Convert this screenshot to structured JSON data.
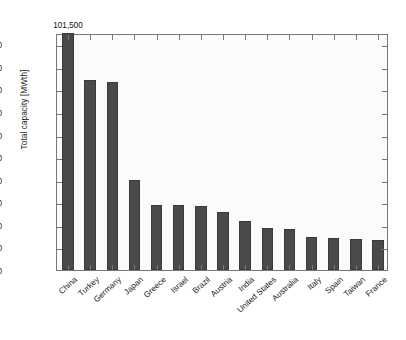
{
  "chart_data": {
    "type": "bar",
    "title": "",
    "xlabel": "",
    "ylabel": "Total capacity [MWth]",
    "ylim": [
      0,
      10500
    ],
    "yticks": [
      0,
      1000,
      2000,
      3000,
      4000,
      5000,
      6000,
      7000,
      8000,
      9000,
      10000
    ],
    "ytick_labels": [
      "0",
      "1,000",
      "2,000",
      "3,000",
      "4,000",
      "5,000",
      "6,000",
      "7,000",
      "8,000",
      "9,000",
      "10,000"
    ],
    "grid": false,
    "legend": null,
    "bar_color": "#4a4a4a",
    "categories": [
      "China",
      "Turkey",
      "Germany",
      "Japan",
      "Greece",
      "Israel",
      "Brazil",
      "Austria",
      "India",
      "United States",
      "Australia",
      "Italy",
      "Spain",
      "Taiwan",
      "France"
    ],
    "values": [
      10500,
      8400,
      8350,
      4000,
      2880,
      2860,
      2840,
      2570,
      2180,
      1860,
      1830,
      1480,
      1420,
      1380,
      1320
    ],
    "annotations": [
      {
        "category": "China",
        "text": "101,500",
        "note": "value label above clipped first bar"
      }
    ]
  },
  "axis": {
    "y_axis_title": "Total capacity [MWth]"
  },
  "caption": {
    "text": ""
  }
}
